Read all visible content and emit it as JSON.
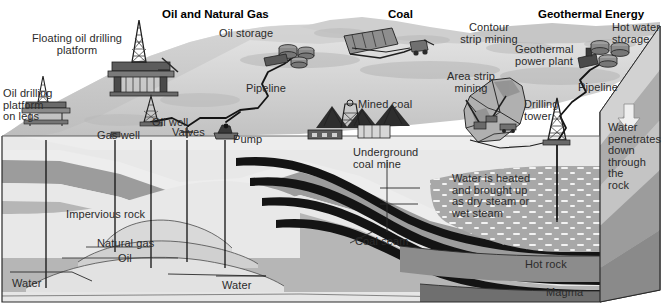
{
  "diagram": {
    "type": "block-diagram",
    "style": "grayscale halftone illustration"
  },
  "headers": [
    {
      "id": "oil-gas",
      "label": "Oil and Natural Gas",
      "x": 162,
      "y": 8
    },
    {
      "id": "coal",
      "label": "Coal",
      "x": 388,
      "y": 8
    },
    {
      "id": "geothermal",
      "label": "Geothermal Energy",
      "x": 538,
      "y": 8
    }
  ],
  "labels": [
    {
      "id": "floating-oil-drilling-platform",
      "label": "Floating oil drilling\nplatform",
      "x": 29,
      "y": 33,
      "align": "center",
      "w": 96
    },
    {
      "id": "oil-storage",
      "label": "Oil storage",
      "x": 219,
      "y": 28,
      "align": "left",
      "w": 70
    },
    {
      "id": "contour-strip-mining",
      "label": "Contour\nstrip mining",
      "x": 452,
      "y": 22,
      "align": "center",
      "w": 74
    },
    {
      "id": "hot-water-storage",
      "label": "Hot water\nstorage",
      "x": 612,
      "y": 22,
      "align": "left",
      "w": 50
    },
    {
      "id": "geothermal-power-plant",
      "label": "Geothermal\npower plant",
      "x": 515,
      "y": 44,
      "align": "left",
      "w": 68
    },
    {
      "id": "oil-drilling-platform-on-legs",
      "label": "Oil drilling\nplatform\non legs",
      "x": 3,
      "y": 88,
      "align": "left",
      "w": 62
    },
    {
      "id": "pipeline-oil",
      "label": "Pipeline",
      "x": 246,
      "y": 83,
      "align": "left",
      "w": 52
    },
    {
      "id": "pipeline-geothermal",
      "label": "Pipeline",
      "x": 578,
      "y": 82,
      "align": "left",
      "w": 52
    },
    {
      "id": "oil-well",
      "label": "Oil well",
      "x": 152,
      "y": 117,
      "align": "left",
      "w": 48
    },
    {
      "id": "area-strip-mining",
      "label": "Area strip\nmining",
      "x": 442,
      "y": 71,
      "align": "center",
      "w": 58
    },
    {
      "id": "drilling-tower",
      "label": "Drilling\ntower",
      "x": 524,
      "y": 99,
      "align": "left",
      "w": 44
    },
    {
      "id": "mined-coal",
      "label": "Mined coal",
      "x": 358,
      "y": 99,
      "align": "left",
      "w": 62
    },
    {
      "id": "gas-well",
      "label": "Gas well",
      "x": 97,
      "y": 130,
      "align": "left",
      "w": 50
    },
    {
      "id": "valves",
      "label": "Valves",
      "x": 172,
      "y": 127,
      "align": "left",
      "w": 42
    },
    {
      "id": "pump",
      "label": "Pump",
      "x": 233,
      "y": 134,
      "align": "left",
      "w": 36
    },
    {
      "id": "underground-coal-mine",
      "label": "Underground\ncoal mine",
      "x": 353,
      "y": 147,
      "align": "left",
      "w": 72
    },
    {
      "id": "water-penetrates-down",
      "label": "Water\npenetrates\ndown\nthrough\nthe\nrock",
      "x": 608,
      "y": 122,
      "align": "left",
      "w": 54
    },
    {
      "id": "water-heated-steam",
      "label": "Water is heated\nand brought up\nas dry steam or\nwet steam",
      "x": 452,
      "y": 173,
      "align": "left",
      "w": 92
    },
    {
      "id": "impervious-rock",
      "label": "Impervious rock",
      "x": 66,
      "y": 209,
      "align": "left",
      "w": 92
    },
    {
      "id": "natural-gas",
      "label": "Natural gas",
      "x": 97,
      "y": 238,
      "align": "left",
      "w": 66
    },
    {
      "id": "coal-seam",
      "label": "Coal seam",
      "x": 355,
      "y": 236,
      "align": "left",
      "w": 62
    },
    {
      "id": "oil",
      "label": "Oil",
      "x": 118,
      "y": 253,
      "align": "left",
      "w": 22
    },
    {
      "id": "hot-rock",
      "label": "Hot rock",
      "x": 525,
      "y": 259,
      "align": "left",
      "w": 50
    },
    {
      "id": "water-left",
      "label": "Water",
      "x": 12,
      "y": 278,
      "align": "left",
      "w": 38
    },
    {
      "id": "water-right",
      "label": "Water",
      "x": 222,
      "y": 280,
      "align": "left",
      "w": 38
    },
    {
      "id": "magma",
      "label": "Magma",
      "x": 546,
      "y": 287,
      "align": "left",
      "w": 44
    }
  ],
  "strata": [
    {
      "id": "impervious-rock-band",
      "name": "Impervious rock",
      "color": "#9a9a9a"
    },
    {
      "id": "light-rock-band",
      "name": "Sedimentary rock",
      "color": "#e9e9e9"
    },
    {
      "id": "natural-gas-band",
      "name": "Natural gas",
      "color": "#d8d8d8"
    },
    {
      "id": "oil-band",
      "name": "Oil",
      "color": "#cfcfcf"
    },
    {
      "id": "water-band",
      "name": "Water",
      "color": "#e2e2e2"
    },
    {
      "id": "coal-seam-band",
      "name": "Coal seam",
      "color": "#111111"
    },
    {
      "id": "hot-rock-band",
      "name": "Hot rock",
      "color": "#8a8a8a"
    },
    {
      "id": "magma-band",
      "name": "Magma",
      "color": "#6e6e6e"
    }
  ],
  "colors": {
    "outline": "#1a1a1a",
    "text": "#2b2b2b",
    "header_text": "#000000",
    "sky": "#ffffff",
    "sea": "#c9c9c9",
    "land_light": "#dcdcdc",
    "land_mid": "#b4b4b4",
    "land_dark": "#8f8f8f",
    "coal_black": "#111111",
    "steam_dot": "#f5f5f5"
  },
  "features": {
    "down_arrow": "arrow-down",
    "well_lines_count": 6,
    "coal_seams_count": 4
  }
}
